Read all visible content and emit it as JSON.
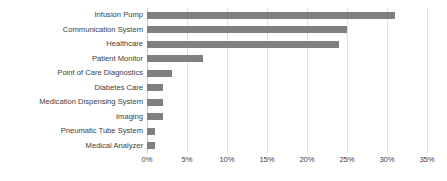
{
  "chart_data": {
    "type": "bar",
    "orientation": "horizontal",
    "title": "",
    "xlabel": "",
    "ylabel": "",
    "xlim": [
      0,
      35
    ],
    "xtick_labels": [
      "0%",
      "5%",
      "10%",
      "15%",
      "20%",
      "25%",
      "30%",
      "35%"
    ],
    "xticks": [
      0,
      5,
      10,
      15,
      20,
      25,
      30,
      35
    ],
    "grid": true,
    "legend": false,
    "bar_color": "#808080",
    "gridline_color": "#e2e2e2",
    "axis_color": "#c9c9c9",
    "categories": [
      "Infusion Pump",
      "Communication System",
      "Healthcare",
      "Patient Monitor",
      "Point of Care Diagnostics",
      "Diabetes Care",
      "Medication Dispensing System",
      "Imaging",
      "Pneumatic Tube System",
      "Medical Analyzer"
    ],
    "values": [
      31,
      25,
      24,
      7,
      3.1,
      2,
      2,
      2,
      1,
      1
    ],
    "value_labels": [
      "31%",
      "25%",
      "24%",
      "7%",
      "3.1%",
      "2%",
      "2%",
      "2%",
      "1%",
      "1%"
    ]
  }
}
